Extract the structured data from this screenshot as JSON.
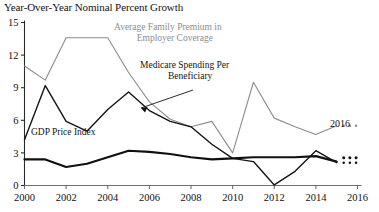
{
  "chart_data": {
    "type": "line",
    "title": "Year-Over-Year Nominal Percent Growth",
    "xlabel": "",
    "ylabel": "",
    "xlim": [
      2000,
      2016
    ],
    "ylim": [
      0,
      15
    ],
    "ytick_labels": [
      "0",
      "3",
      "6",
      "9",
      "12",
      "15"
    ],
    "ytick_values": [
      0,
      3,
      6,
      9,
      12,
      15
    ],
    "xtick_labels": [
      "2000",
      "2002",
      "2004",
      "2006",
      "2008",
      "2010",
      "2012",
      "2014",
      "2016"
    ],
    "xtick_values": [
      2000,
      2002,
      2004,
      2006,
      2008,
      2010,
      2012,
      2014,
      2016
    ],
    "grid": false,
    "legend_position": "inline-annotations",
    "x": [
      2000,
      2001,
      2002,
      2003,
      2004,
      2005,
      2006,
      2007,
      2008,
      2009,
      2010,
      2011,
      2012,
      2013,
      2014,
      2015
    ],
    "series": [
      {
        "name": "Average Family Premium in Employer Coverage",
        "color": "#8d8d8d",
        "width": 1.1,
        "values": [
          11.0,
          9.7,
          13.6,
          13.6,
          13.6,
          10.4,
          7.7,
          6.1,
          5.4,
          5.9,
          3.0,
          9.5,
          6.2,
          5.4,
          4.7,
          5.5
        ],
        "end_dots": {
          "count": 3,
          "value": 5.5
        }
      },
      {
        "name": "Medicare Spending Per Beneficiary",
        "color": "#141414",
        "width": 1.4,
        "values": [
          4.2,
          9.2,
          5.9,
          5.0,
          7.0,
          8.6,
          6.9,
          5.9,
          5.4,
          3.8,
          2.5,
          2.2,
          0.05,
          1.3,
          3.2,
          2.1
        ],
        "end_dots": {
          "count": 3,
          "value": 2.1
        }
      },
      {
        "name": "GDP Price Index",
        "color": "#101010",
        "width": 2.2,
        "values": [
          2.4,
          2.4,
          1.7,
          2.0,
          2.6,
          3.2,
          3.1,
          2.9,
          2.6,
          2.4,
          2.5,
          2.6,
          2.6,
          2.6,
          2.7,
          2.2
        ],
        "end_dots": {
          "count": 3,
          "value": 2.55
        }
      }
    ],
    "annotations": [
      {
        "id": "premium",
        "line1": "Average Family Premium in",
        "line2": "Employer Coverage",
        "color": "#8d8d8d"
      },
      {
        "id": "medicare",
        "line1": "Medicare Spending Per",
        "line2": "Beneficiary",
        "color": "#141414"
      },
      {
        "id": "gdp",
        "line1": "GDP Price Index",
        "line2": "",
        "color": "#141414"
      },
      {
        "id": "year",
        "line1": "2016",
        "line2": "",
        "color": "#141414"
      }
    ]
  }
}
